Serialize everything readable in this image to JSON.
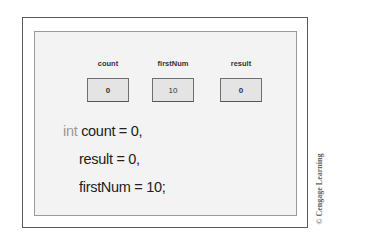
{
  "diagram": {
    "variables": [
      {
        "name": "count",
        "value": "0"
      },
      {
        "name": "firstNum",
        "value": "10"
      },
      {
        "name": "result",
        "value": "0"
      }
    ],
    "code": {
      "keyword": "int",
      "lines": [
        "count = 0,",
        "result = 0,",
        "firstNum = 10;"
      ]
    },
    "copyright": "© Cengage Learning",
    "colors": {
      "panel_background": "#f3f3f3",
      "box_fill": "#e4e4e4",
      "keyword": "#9a9a9a",
      "text": "#222222"
    }
  }
}
